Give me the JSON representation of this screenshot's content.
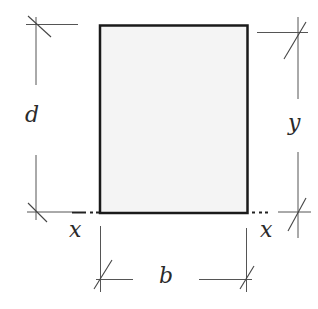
{
  "diagram": {
    "type": "rectangular cross-section with dimensions",
    "section": {
      "fill": "#f4f4f4",
      "stroke": "#1a1a1a"
    },
    "labels": {
      "depth": "d",
      "centroid_distance": "y",
      "width": "b",
      "axis_left": "x",
      "axis_right": "x"
    }
  }
}
